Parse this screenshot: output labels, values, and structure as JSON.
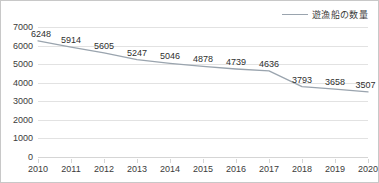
{
  "legend": {
    "label": "遊漁船の数量",
    "marker_icon": "line-marker-icon",
    "color": "#9aa4ae",
    "position": "top-right"
  },
  "axes": {
    "y_ticks": [
      "0",
      "1000",
      "2000",
      "3000",
      "4000",
      "5000",
      "6000",
      "7000"
    ],
    "x_ticks": [
      "2010",
      "2011",
      "2012",
      "2013",
      "2014",
      "2015",
      "2016",
      "2017",
      "2018",
      "2019",
      "2020"
    ],
    "ylabel": "",
    "xlabel": ""
  },
  "chart_data": {
    "type": "line",
    "title": "",
    "subtitle": "",
    "xlabel": "",
    "ylabel": "",
    "categories": [
      "2010",
      "2011",
      "2012",
      "2013",
      "2014",
      "2015",
      "2016",
      "2017",
      "2018",
      "2019",
      "2020"
    ],
    "series": [
      {
        "name": "遊漁船の数量",
        "color": "#9aa4ae",
        "values": [
          6248,
          5914,
          5605,
          5247,
          5046,
          4878,
          4739,
          4636,
          3793,
          3658,
          3507
        ],
        "data_labels": [
          "6248",
          "5914",
          "5605",
          "5247",
          "5046",
          "4878",
          "4739",
          "4636",
          "3793",
          "3658",
          "3507"
        ]
      }
    ],
    "ylim": [
      0,
      7000
    ],
    "ytick_step": 1000,
    "grid": "horizontal",
    "legend_position": "top-right",
    "markers": false,
    "data_labels_shown": true
  }
}
